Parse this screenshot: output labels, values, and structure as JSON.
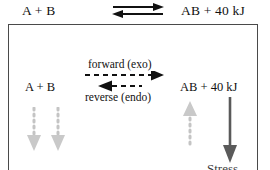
{
  "equation_top": {
    "reactants": "A  +  B",
    "products": "AB  +  40 kJ",
    "arrow": "equilibrium-double-arrow"
  },
  "box": {
    "equation": {
      "reactants": "A  +  B",
      "products": "AB  + 40 kJ"
    },
    "labels": {
      "forward": "forward (exo)",
      "reverse": "reverse (endo)"
    },
    "arrows": {
      "forward": "dashed-right-arrow",
      "reverse": "dashed-left-arrow",
      "shift_reactant_1": "dotted-down-arrow",
      "shift_reactant_2": "dotted-down-arrow",
      "shift_product": "dotted-up-arrow",
      "stress": "solid-down-arrow"
    },
    "stress_label": "Stress"
  },
  "colors": {
    "ink": "#111111",
    "box_border": "#4a4a4a",
    "dotted_gray": "#c4c4c4",
    "stress_gray": "#5a5a5a"
  }
}
